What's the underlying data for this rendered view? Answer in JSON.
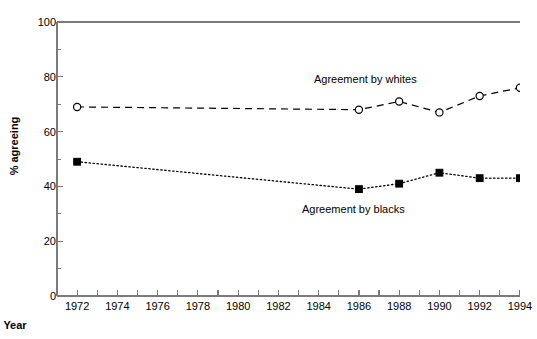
{
  "chart_data": {
    "type": "line",
    "title": "",
    "xlabel": "Year",
    "ylabel": "% agreeing",
    "xlim": [
      1971,
      1994.6
    ],
    "ylim": [
      0,
      100
    ],
    "grid": false,
    "legend_position": "inline-annotations",
    "x": [
      1972,
      1986,
      1988,
      1990,
      1992,
      1994
    ],
    "series": [
      {
        "name": "Agreement by whites",
        "marker": "open-circle",
        "linestyle": "dashed",
        "color": "#000000",
        "values": [
          69,
          68,
          71,
          67,
          73,
          76
        ]
      },
      {
        "name": "Agreement by blacks",
        "marker": "filled-square",
        "linestyle": "dotted",
        "color": "#000000",
        "values": [
          49,
          39,
          41,
          45,
          43,
          43
        ]
      }
    ],
    "yticks": [
      0,
      20,
      40,
      60,
      80,
      100
    ],
    "ytick_labels": [
      "0",
      "20",
      "40",
      "60",
      "80",
      "100"
    ],
    "yminor_ticks": [
      10,
      30,
      50,
      70,
      90
    ],
    "xticks": [
      1972,
      1973,
      1974,
      1975,
      1976,
      1977,
      1978,
      1979,
      1980,
      1981,
      1982,
      1983,
      1984,
      1985,
      1986,
      1987,
      1988,
      1989,
      1990,
      1991,
      1992,
      1993,
      1994
    ],
    "xtick_labels": [
      {
        "value": 1972,
        "label": "1972"
      },
      {
        "value": 1974,
        "label": "1974"
      },
      {
        "value": 1976,
        "label": "1976"
      },
      {
        "value": 1978,
        "label": "1978"
      },
      {
        "value": 1980,
        "label": "1980"
      },
      {
        "value": 1982,
        "label": "1982"
      },
      {
        "value": 1984,
        "label": "1984"
      },
      {
        "value": 1986,
        "label": "1986"
      },
      {
        "value": 1988,
        "label": "1988"
      },
      {
        "value": 1990,
        "label": "1990"
      },
      {
        "value": 1992,
        "label": "1992"
      },
      {
        "value": 1994,
        "label": "1994"
      }
    ],
    "annotations": [
      {
        "text": "Agreement by whites",
        "x": 1988,
        "y": 80
      },
      {
        "text": "Agreement by blacks",
        "x": 1988,
        "y": 30
      }
    ]
  },
  "axes": {
    "ylabel": "% agreeing",
    "xlabel": "Year"
  },
  "annotations": {
    "whites": "Agreement by whites",
    "blacks": "Agreement by blacks"
  },
  "colors": {
    "ink": "#000000",
    "frame": "#7a7a7a",
    "background": "#ffffff"
  }
}
